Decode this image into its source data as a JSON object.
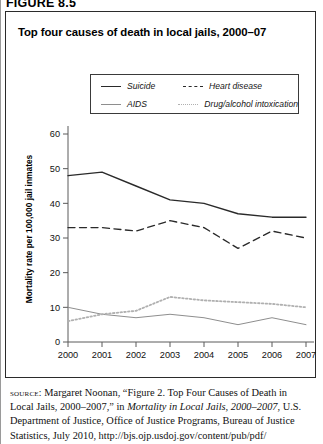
{
  "figure_number": "FIGURE 8.5",
  "chart_title": "Top four causes of death in local jails, 2000–07",
  "legend": {
    "suicide": "Suicide",
    "heart_disease": "Heart disease",
    "aids": "AIDS",
    "drug_alcohol": "Drug/alcohol intoxication"
  },
  "source": {
    "label": "source:",
    "text_1": " Margaret Noonan, “Figure 2. Top Four Causes of Death in Local Jails, 2000–2007,” in ",
    "italic_1": "Mortality in Local Jails, 2000–2007",
    "text_2": ", U.S. Department of Justice, Office of Justice Programs, Bureau of Justice Statistics, July 2010, http://bjs.ojp.usdoj.gov/content/pub/pdf/"
  },
  "colors": {
    "suicide": "#2a2a2a",
    "heart_disease": "#2a2a2a",
    "aids": "#8e8e8e",
    "drug_alcohol": "#b0b0b0",
    "axis": "#5a5a5a",
    "border": "#2b2b2b"
  },
  "chart_data": {
    "type": "line",
    "title": "Top four causes of death in local jails, 2000–07",
    "xlabel": "",
    "ylabel": "Mortality rate per 100,000 jail inmates",
    "x": [
      2000,
      2001,
      2002,
      2003,
      2004,
      2005,
      2006,
      2007
    ],
    "xtick_labels": [
      "2000",
      "2001",
      "2002",
      "2003",
      "2004",
      "2005",
      "2006",
      "2007"
    ],
    "ytick_labels": [
      "0",
      "10",
      "20",
      "30",
      "40",
      "50",
      "60"
    ],
    "yticks": [
      0,
      10,
      20,
      30,
      40,
      50,
      60
    ],
    "ylim": [
      0,
      60
    ],
    "xlim": [
      2000,
      2007
    ],
    "grid": false,
    "legend_position": "above-plot",
    "series": [
      {
        "name": "Suicide",
        "style": "solid",
        "color": "#2a2a2a",
        "values": [
          48,
          49,
          45,
          41,
          40,
          37,
          36,
          36
        ]
      },
      {
        "name": "Heart disease",
        "style": "dashed",
        "color": "#2a2a2a",
        "values": [
          33,
          33,
          32,
          35,
          33,
          27,
          32,
          30
        ]
      },
      {
        "name": "AIDS",
        "style": "solid-thin",
        "color": "#8e8e8e",
        "values": [
          10,
          8,
          7,
          8,
          7,
          5,
          7,
          5
        ]
      },
      {
        "name": "Drug/alcohol intoxication",
        "style": "dotted",
        "color": "#b0b0b0",
        "values": [
          6,
          8,
          9,
          13,
          12,
          11.5,
          11,
          10
        ]
      }
    ]
  }
}
